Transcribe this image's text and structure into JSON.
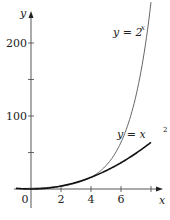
{
  "chart_data": {
    "type": "line",
    "title": "",
    "xlabel": "x",
    "ylabel": "y",
    "xlim": [
      -1.2,
      8.6
    ],
    "ylim": [
      -20,
      260
    ],
    "grid": false,
    "x_ticks": [
      0,
      2,
      4,
      6,
      8
    ],
    "x_tick_labels": [
      "0",
      "2",
      "4",
      "6",
      ""
    ],
    "y_ticks": [
      50,
      100,
      150,
      200
    ],
    "y_tick_labels": [
      "",
      "100",
      "",
      "200"
    ],
    "series": [
      {
        "name": "y = 2^x",
        "label_text": "y = 2",
        "label_exponent": "x",
        "color": "#555555",
        "stroke_width": 0.9,
        "x": [
          -1,
          0,
          1,
          2,
          3,
          4,
          5,
          6,
          7,
          7.5,
          8
        ],
        "values": [
          0.5,
          1,
          2,
          4,
          8,
          16,
          32,
          64,
          128,
          181,
          256
        ]
      },
      {
        "name": "y = x^2",
        "label_text": "y = x",
        "label_exponent": "2",
        "color": "#111111",
        "stroke_width": 1.6,
        "x": [
          -1,
          0,
          1,
          2,
          3,
          4,
          5,
          6,
          7,
          8
        ],
        "values": [
          1,
          0,
          1,
          4,
          9,
          16,
          25,
          36,
          49,
          64
        ]
      }
    ]
  }
}
